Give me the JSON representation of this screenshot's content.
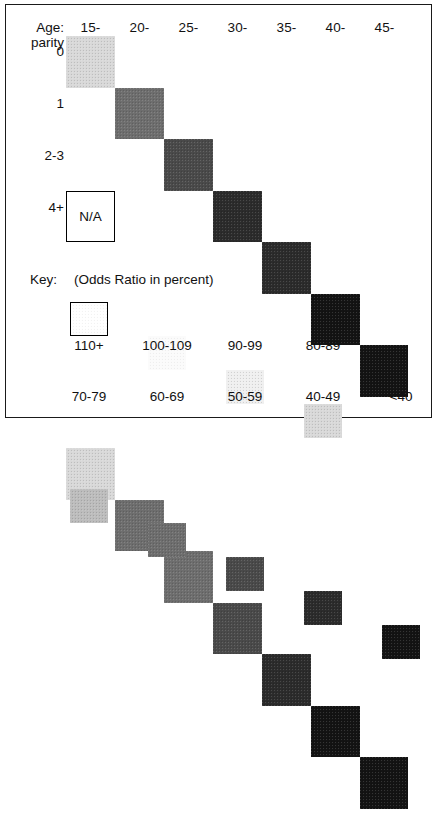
{
  "chart_data": {
    "type": "heatmap",
    "title": "",
    "xlabel": "Age:",
    "ylabel": "parity",
    "x_categories": [
      "15-",
      "20-",
      "25-",
      "30-",
      "35-",
      "40-",
      "45-"
    ],
    "y_categories": [
      "0",
      "1",
      "2-3",
      "4+"
    ],
    "value_unit": "Odds Ratio in percent",
    "na_label": "N/A",
    "legend_position": "below",
    "grid": false,
    "bins": [
      {
        "label": "110+",
        "tone": "t110",
        "outline": true,
        "hex": "#ffffff"
      },
      {
        "label": "100-109",
        "tone": "t100",
        "outline": false,
        "hex": "#fbfbfb"
      },
      {
        "label": "90-99",
        "tone": "t90",
        "outline": false,
        "hex": "#f0f0f0"
      },
      {
        "label": "80-89",
        "tone": "t80",
        "outline": false,
        "hex": "#d9d9d9"
      },
      {
        "label": "70-79",
        "tone": "t70",
        "outline": false,
        "hex": "#bdbdbd"
      },
      {
        "label": "60-69",
        "tone": "t60",
        "outline": false,
        "hex": "#6e6e6e"
      },
      {
        "label": "50-59",
        "tone": "t50",
        "outline": false,
        "hex": "#4a4a4a"
      },
      {
        "label": "40-49",
        "tone": "t40",
        "outline": false,
        "hex": "#2b2b2b"
      },
      {
        "label": "<40",
        "tone": "t00",
        "outline": false,
        "hex": "#131313"
      }
    ],
    "rows": [
      {
        "parity": "0",
        "cells": [
          {
            "age": "15-",
            "bin": "80-89",
            "tone": "t80"
          },
          {
            "age": "20-",
            "bin": "60-69",
            "tone": "t60"
          },
          {
            "age": "25-",
            "bin": "50-59",
            "tone": "t50"
          },
          {
            "age": "30-",
            "bin": "40-49",
            "tone": "t40"
          },
          {
            "age": "35-",
            "bin": "40-49",
            "tone": "t40"
          },
          {
            "age": "40-",
            "bin": "<40",
            "tone": "t00"
          },
          {
            "age": "45-",
            "bin": "<40",
            "tone": "t00"
          }
        ]
      },
      {
        "parity": "1",
        "cells": [
          {
            "age": "15-",
            "bin": "80-89",
            "tone": "t80"
          },
          {
            "age": "20-",
            "bin": "60-69",
            "tone": "t60"
          },
          {
            "age": "25-",
            "bin": "60-69",
            "tone": "t60"
          },
          {
            "age": "30-",
            "bin": "50-59",
            "tone": "t50"
          },
          {
            "age": "35-",
            "bin": "40-49",
            "tone": "t40"
          },
          {
            "age": "40-",
            "bin": "<40",
            "tone": "t00"
          },
          {
            "age": "45-",
            "bin": "<40",
            "tone": "t00"
          }
        ]
      },
      {
        "parity": "2-3",
        "cells": [
          {
            "age": "15-",
            "bin": "90-99",
            "tone": "t90"
          },
          {
            "age": "20-",
            "bin": "80-89",
            "tone": "t80"
          },
          {
            "age": "25-",
            "bin": "60-69",
            "tone": "t60"
          },
          {
            "age": "30-",
            "bin": "50-59",
            "tone": "t50"
          },
          {
            "age": "35-",
            "bin": "40-49",
            "tone": "t40"
          },
          {
            "age": "40-",
            "bin": "40-49",
            "tone": "t40"
          },
          {
            "age": "45-",
            "bin": "<40",
            "tone": "t00"
          }
        ]
      },
      {
        "parity": "4+",
        "cells": [
          {
            "age": "15-",
            "bin": "N/A",
            "tone": "na"
          },
          {
            "age": "20-",
            "bin": "80-89",
            "tone": "t80"
          },
          {
            "age": "25-",
            "bin": "60-69",
            "tone": "t60"
          },
          {
            "age": "30-",
            "bin": "50-59",
            "tone": "t50"
          },
          {
            "age": "35-",
            "bin": "50-59",
            "tone": "t50"
          },
          {
            "age": "40-",
            "bin": "40-49",
            "tone": "t40"
          },
          {
            "age": "45-",
            "bin": "<40",
            "tone": "t00"
          }
        ]
      }
    ]
  },
  "axes": {
    "age_label": "Age:",
    "parity_label": "parity"
  },
  "legend": {
    "key_label": "Key:",
    "key_caption": "(Odds Ratio in percent)"
  }
}
